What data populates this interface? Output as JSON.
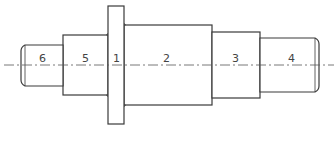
{
  "diagram": {
    "type": "stepped-shaft-drawing",
    "centerline_y": 65,
    "colors": {
      "line": "#3a3a3a",
      "centerline": "#555555",
      "label": "#444444",
      "background": "#ffffff"
    },
    "sections": [
      {
        "label": "6",
        "x0": 21,
        "x1": 63,
        "y0": 45,
        "y1": 86
      },
      {
        "label": "5",
        "x0": 63,
        "x1": 108,
        "y0": 35,
        "y1": 95
      },
      {
        "label": "1",
        "x0": 108,
        "x1": 124,
        "y0": 6,
        "y1": 124
      },
      {
        "label": "2",
        "x0": 124,
        "x1": 212,
        "y0": 25,
        "y1": 105
      },
      {
        "label": "3",
        "x0": 212,
        "x1": 260,
        "y0": 32,
        "y1": 98
      },
      {
        "label": "4",
        "x0": 260,
        "x1": 319,
        "y0": 38,
        "y1": 92
      }
    ]
  },
  "labels": {
    "s6": "6",
    "s5": "5",
    "s1": "1",
    "s2": "2",
    "s3": "3",
    "s4": "4"
  }
}
